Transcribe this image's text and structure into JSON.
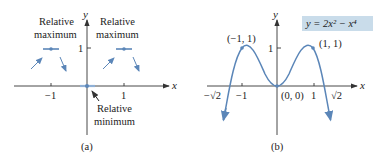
{
  "figure": {
    "panel_a": {
      "caption": "(a)",
      "x_axis_label": "x",
      "y_axis_label": "y",
      "x_ticks": [
        "−1",
        "1"
      ],
      "y_ticks": [
        "1"
      ],
      "annotation_left_max_line1": "Relative",
      "annotation_left_max_line2": "maximum",
      "annotation_right_max_line1": "Relative",
      "annotation_right_max_line2": "maximum",
      "annotation_min_line1": "Relative",
      "annotation_min_line2": "minimum"
    },
    "panel_b": {
      "caption": "(b)",
      "x_axis_label": "x",
      "y_axis_label": "y",
      "x_ticks": [
        "−1",
        "1"
      ],
      "y_ticks": [
        "1"
      ],
      "neg_root_label": "−√2",
      "pos_root_label": "√2",
      "point_left_max": "(−1, 1)",
      "point_right_max": "(1, 1)",
      "point_origin": "(0, 0)",
      "equation": "y = 2x² − x⁴",
      "equation_bg": "#c9dcea"
    },
    "colors": {
      "curve": "#5b86b8",
      "axis": "#333333",
      "point": "#5b86b8"
    }
  }
}
